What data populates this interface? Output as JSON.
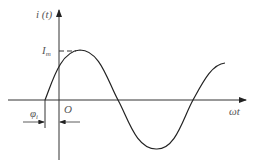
{
  "diagram": {
    "type": "sinusoidal waveform",
    "y_axis_label": "i (t)",
    "x_axis_label": "ωt",
    "origin_label": "O",
    "amplitude_label": "I",
    "amplitude_sub": "m",
    "phase_label": "φ",
    "phase_sub": "i",
    "line_color": "#222222"
  }
}
